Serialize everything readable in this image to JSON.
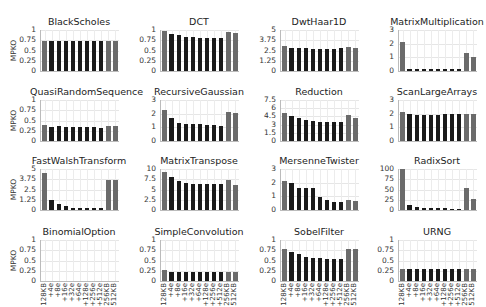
{
  "chart_data": {
    "type": "bar",
    "layout": "4x4 grid of small multiples",
    "ylabel": "MPKO",
    "categories": [
      "128KB",
      "+4e",
      "+8e",
      "+16e",
      "+32e",
      "+64e",
      "+128e",
      "+256e",
      "+512e",
      "256KB",
      "512KB"
    ],
    "bar_colors": {
      "baseline": "#6b6b6b",
      "variant": "#1a1a1a"
    },
    "bar_color_pattern": [
      "baseline",
      "variant",
      "variant",
      "variant",
      "variant",
      "variant",
      "variant",
      "variant",
      "variant",
      "baseline",
      "baseline"
    ],
    "grid": true,
    "panels": [
      {
        "title": "BlackScholes",
        "ylim": [
          0,
          1
        ],
        "yticks": [
          "0",
          "0.25",
          "0.5",
          "0.75",
          "1"
        ],
        "values": [
          0.72,
          0.72,
          0.72,
          0.72,
          0.72,
          0.72,
          0.72,
          0.72,
          0.72,
          0.73,
          0.73
        ]
      },
      {
        "title": "DCT",
        "ylim": [
          0,
          1
        ],
        "yticks": [
          "0",
          "0.25",
          "0.5",
          "0.75",
          "1"
        ],
        "values": [
          0.97,
          0.9,
          0.87,
          0.84,
          0.82,
          0.81,
          0.81,
          0.8,
          0.8,
          0.95,
          0.93
        ]
      },
      {
        "title": "DwtHaar1D",
        "ylim": [
          0,
          5
        ],
        "yticks": [
          "0",
          "1.25",
          "2.5",
          "3.75",
          "5"
        ],
        "values": [
          3.1,
          2.8,
          2.8,
          2.75,
          2.72,
          2.72,
          2.72,
          2.72,
          2.75,
          2.95,
          2.8
        ]
      },
      {
        "title": "MatrixMultiplication",
        "ylim": [
          0,
          3
        ],
        "yticks": [
          "0",
          "1",
          "2",
          "3"
        ],
        "values": [
          2.1,
          0.15,
          0.12,
          0.12,
          0.12,
          0.12,
          0.12,
          0.12,
          0.12,
          1.35,
          1.05
        ]
      },
      {
        "title": "QuasiRandomSequence",
        "ylim": [
          0,
          1
        ],
        "yticks": [
          "0",
          "0.25",
          "0.5",
          "0.75",
          "1"
        ],
        "values": [
          0.4,
          0.33,
          0.37,
          0.35,
          0.35,
          0.34,
          0.35,
          0.33,
          0.32,
          0.37,
          0.37
        ]
      },
      {
        "title": "RecursiveGaussian",
        "ylim": [
          0,
          3
        ],
        "yticks": [
          "0",
          "1",
          "2",
          "3"
        ],
        "values": [
          2.3,
          1.7,
          1.35,
          1.25,
          1.22,
          1.22,
          1.2,
          1.15,
          1.12,
          2.15,
          2.05
        ]
      },
      {
        "title": "Reduction",
        "ylim": [
          0,
          7.5
        ],
        "yticks": [
          "0",
          "1.5",
          "3",
          "4.5",
          "6",
          "7.5"
        ],
        "values": [
          5.2,
          4.5,
          4.2,
          3.9,
          3.7,
          3.5,
          3.4,
          3.4,
          3.4,
          4.8,
          4.3
        ]
      },
      {
        "title": "ScanLargeArrays",
        "ylim": [
          0,
          3
        ],
        "yticks": [
          "0",
          "1",
          "2",
          "3"
        ],
        "values": [
          2.1,
          1.95,
          1.9,
          1.92,
          1.9,
          1.92,
          1.95,
          1.95,
          1.95,
          2.0,
          2.0
        ]
      },
      {
        "title": "FastWalshTransform",
        "ylim": [
          0,
          5
        ],
        "yticks": [
          "0",
          "1.25",
          "2.5",
          "3.75",
          "5"
        ],
        "values": [
          4.5,
          1.2,
          0.7,
          0.45,
          0.3,
          0.25,
          0.22,
          0.2,
          0.2,
          3.7,
          3.6
        ]
      },
      {
        "title": "MatrixTranspose",
        "ylim": [
          0,
          10
        ],
        "yticks": [
          "0",
          "2.5",
          "5",
          "7.5",
          "10"
        ],
        "values": [
          9.3,
          8.1,
          7.0,
          6.6,
          6.4,
          6.3,
          6.3,
          6.3,
          6.3,
          7.3,
          6.1
        ]
      },
      {
        "title": "MersenneTwister",
        "ylim": [
          0,
          3
        ],
        "yticks": [
          "0",
          "1",
          "2",
          "3"
        ],
        "values": [
          2.1,
          2.0,
          1.6,
          1.6,
          1.6,
          0.95,
          0.75,
          0.6,
          0.6,
          0.75,
          0.65
        ]
      },
      {
        "title": "RadixSort",
        "ylim": [
          0,
          100
        ],
        "yticks": [
          "0",
          "25",
          "50",
          "75",
          "100"
        ],
        "values": [
          100,
          13,
          7,
          6,
          5,
          5,
          4,
          3,
          3,
          53,
          27
        ]
      },
      {
        "title": "BinomialOption",
        "ylim": [
          0,
          1
        ],
        "yticks": [
          "0",
          "0.25",
          "0.5",
          "0.75",
          "1"
        ],
        "values": [
          0,
          0,
          0,
          0,
          0,
          0,
          0,
          0,
          0,
          0,
          0
        ]
      },
      {
        "title": "SimpleConvolution",
        "ylim": [
          0,
          1
        ],
        "yticks": [
          "0",
          "0.25",
          "0.5",
          "0.75",
          "1"
        ],
        "values": [
          0.27,
          0.21,
          0.21,
          0.21,
          0.21,
          0.21,
          0.21,
          0.21,
          0.21,
          0.21,
          0.21
        ]
      },
      {
        "title": "SobelFilter",
        "ylim": [
          0,
          1
        ],
        "yticks": [
          "0",
          "0.25",
          "0.5",
          "0.75",
          "1"
        ],
        "values": [
          0.78,
          0.7,
          0.65,
          0.58,
          0.55,
          0.55,
          0.54,
          0.54,
          0.54,
          0.78,
          0.78
        ]
      },
      {
        "title": "URNG",
        "ylim": [
          0,
          1
        ],
        "yticks": [
          "0",
          "0.25",
          "0.5",
          "0.75",
          "1"
        ],
        "values": [
          0.3,
          0.3,
          0.3,
          0.3,
          0.3,
          0.3,
          0.3,
          0.3,
          0.3,
          0.3,
          0.3
        ]
      }
    ]
  }
}
